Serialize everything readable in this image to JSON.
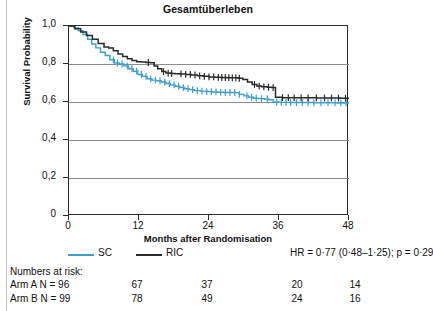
{
  "chart_data": {
    "type": "line",
    "title": "Gesamtüberleben",
    "xlabel": "Months after Randomisation",
    "ylabel": "Survival Probability",
    "xlim": [
      0,
      48
    ],
    "ylim": [
      0,
      1
    ],
    "xticks": [
      "0",
      "12",
      "24",
      "36",
      "48"
    ],
    "xtick_values": [
      0,
      12,
      24,
      36,
      48
    ],
    "yticks": [
      "0",
      "0,2",
      "0,4",
      "0,6",
      "0,8",
      "1,0"
    ],
    "ytick_values": [
      0,
      0.2,
      0.4,
      0.6,
      0.8,
      1.0
    ],
    "grid": true,
    "legend_position": "below-axis",
    "series": [
      {
        "name": "SC",
        "color": "#3d9fd0",
        "points": [
          [
            0,
            1.0
          ],
          [
            0.8,
            0.99
          ],
          [
            1.6,
            0.975
          ],
          [
            2.4,
            0.955
          ],
          [
            3.2,
            0.93
          ],
          [
            3.9,
            0.905
          ],
          [
            4.6,
            0.885
          ],
          [
            5.4,
            0.862
          ],
          [
            6.2,
            0.845
          ],
          [
            7.0,
            0.822
          ],
          [
            7.8,
            0.805
          ],
          [
            8.6,
            0.8
          ],
          [
            9.4,
            0.79
          ],
          [
            10.2,
            0.775
          ],
          [
            11.0,
            0.762
          ],
          [
            11.8,
            0.745
          ],
          [
            12.6,
            0.735
          ],
          [
            13.4,
            0.722
          ],
          [
            14.2,
            0.715
          ],
          [
            15.0,
            0.712
          ],
          [
            15.8,
            0.705
          ],
          [
            16.6,
            0.697
          ],
          [
            17.4,
            0.69
          ],
          [
            18.2,
            0.683
          ],
          [
            19.0,
            0.676
          ],
          [
            19.8,
            0.67
          ],
          [
            20.6,
            0.665
          ],
          [
            21.5,
            0.66
          ],
          [
            22.5,
            0.657
          ],
          [
            23.5,
            0.655
          ],
          [
            24.5,
            0.653
          ],
          [
            25.5,
            0.651
          ],
          [
            26.5,
            0.65
          ],
          [
            27.5,
            0.65
          ],
          [
            28.5,
            0.648
          ],
          [
            29.2,
            0.64
          ],
          [
            30.0,
            0.632
          ],
          [
            30.8,
            0.625
          ],
          [
            31.6,
            0.62
          ],
          [
            32.5,
            0.618
          ],
          [
            33.5,
            0.616
          ],
          [
            34.3,
            0.612
          ],
          [
            35.0,
            0.6
          ],
          [
            36.0,
            0.598
          ],
          [
            38.0,
            0.597
          ],
          [
            40.0,
            0.597
          ],
          [
            42.0,
            0.596
          ],
          [
            44.0,
            0.596
          ],
          [
            46.0,
            0.595
          ],
          [
            48.0,
            0.595
          ]
        ],
        "censor_months": [
          7.6,
          8.3,
          9.1,
          10.0,
          10.8,
          11.6,
          12.4,
          13.2,
          14.0,
          14.8,
          15.6,
          16.4,
          17.2,
          18.0,
          18.8,
          19.6,
          20.4,
          21.2,
          22.0,
          22.8,
          23.6,
          24.4,
          25.2,
          26.0,
          26.8,
          27.6,
          28.4,
          29.2,
          30.5,
          31.3,
          32.1,
          33.0,
          34.0,
          35.6,
          36.4,
          37.2,
          38.0,
          39.0,
          40.0,
          41.0,
          42.0,
          43.2,
          44.4,
          45.6,
          46.6,
          47.5
        ]
      },
      {
        "name": "RIC",
        "color": "#2b2b2b",
        "points": [
          [
            0,
            1.0
          ],
          [
            1.0,
            0.985
          ],
          [
            2.0,
            0.968
          ],
          [
            3.0,
            0.95
          ],
          [
            4.0,
            0.93
          ],
          [
            5.0,
            0.908
          ],
          [
            6.0,
            0.89
          ],
          [
            6.8,
            0.884
          ],
          [
            7.6,
            0.87
          ],
          [
            8.4,
            0.853
          ],
          [
            9.2,
            0.84
          ],
          [
            10.0,
            0.828
          ],
          [
            10.8,
            0.818
          ],
          [
            11.6,
            0.812
          ],
          [
            12.4,
            0.81
          ],
          [
            13.2,
            0.808
          ],
          [
            14.0,
            0.806
          ],
          [
            14.6,
            0.79
          ],
          [
            15.2,
            0.775
          ],
          [
            15.9,
            0.76
          ],
          [
            16.6,
            0.752
          ],
          [
            17.4,
            0.75
          ],
          [
            18.2,
            0.749
          ],
          [
            19.0,
            0.748
          ],
          [
            20.0,
            0.745
          ],
          [
            21.0,
            0.742
          ],
          [
            22.0,
            0.738
          ],
          [
            23.0,
            0.735
          ],
          [
            24.0,
            0.732
          ],
          [
            25.0,
            0.73
          ],
          [
            26.0,
            0.729
          ],
          [
            27.0,
            0.728
          ],
          [
            28.0,
            0.727
          ],
          [
            29.0,
            0.725
          ],
          [
            29.8,
            0.718
          ],
          [
            30.6,
            0.705
          ],
          [
            31.4,
            0.692
          ],
          [
            32.2,
            0.684
          ],
          [
            33.0,
            0.68
          ],
          [
            34.0,
            0.678
          ],
          [
            34.8,
            0.676
          ],
          [
            35.4,
            0.625
          ],
          [
            36.5,
            0.623
          ],
          [
            38.5,
            0.622
          ],
          [
            40.5,
            0.622
          ],
          [
            42.5,
            0.621
          ],
          [
            44.5,
            0.621
          ],
          [
            46.5,
            0.62
          ],
          [
            48.0,
            0.62
          ]
        ],
        "censor_months": [
          13.6,
          16.2,
          17.0,
          17.6,
          19.2,
          20.0,
          20.8,
          21.6,
          22.4,
          23.2,
          24.0,
          24.8,
          25.6,
          26.2,
          26.8,
          27.4,
          28.0,
          28.6,
          29.2,
          31.8,
          32.6,
          33.4,
          34.2,
          35.0,
          36.6,
          37.6,
          38.6,
          39.8,
          41.0,
          42.4,
          43.8,
          45.0,
          46.2,
          47.4
        ]
      }
    ],
    "annotations": {
      "hazard_ratio": "HR = 0·77 (0·48–1·25); p = 0·29"
    },
    "risk_table": {
      "title": "Numbers at risk:",
      "rows": [
        {
          "label": "Arm A  N = 96",
          "values": [
            "67",
            "37",
            "20",
            "14"
          ]
        },
        {
          "label": "Arm B  N = 99",
          "values": [
            "78",
            "49",
            "24",
            "16"
          ]
        }
      ]
    }
  }
}
